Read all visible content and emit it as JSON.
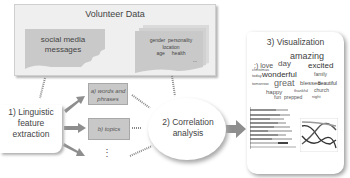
{
  "volunteer_data": {
    "title": "Volunteer Data",
    "left_doc": {
      "line1": "social media",
      "line2": "messages"
    },
    "right_doc": {
      "words": [
        "gender",
        "personality",
        "location",
        "age",
        "health",
        "..."
      ]
    }
  },
  "step1": {
    "line1": "1) Linguistic",
    "line2": "feature",
    "line3": "extraction"
  },
  "features": [
    {
      "line1": "a) words and",
      "line2": "phrases"
    },
    {
      "line1": "b) topics"
    },
    {
      "line1": "⋮"
    }
  ],
  "step2": {
    "line1": "2) Correlation",
    "line2": "analysis"
  },
  "step3": {
    "title": "3) Visualization",
    "word_cloud": [
      "amazing",
      ":) love",
      "day",
      "excited",
      "wonderful",
      "family",
      "great",
      "blessed",
      "beautiful",
      "happy",
      "church",
      "fun",
      "prepped",
      "today",
      "tomorrow",
      "christmas",
      "thankful",
      "night"
    ]
  },
  "colors": {
    "panel_bg": "#efefef",
    "doc_fill": "#c9c9c9",
    "feature_fill": "#c8c8c8",
    "arrow": "#8e8e8e",
    "text": "#444444"
  }
}
